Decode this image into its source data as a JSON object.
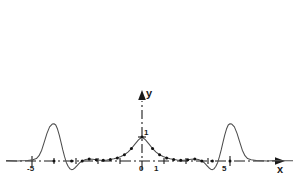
{
  "figure": {
    "background_color": "#ffffff",
    "curve_color": "#4d4d4d",
    "axis_color": "#1a1a1a",
    "marker_color": "#111111"
  },
  "axes": {
    "x_axis_label": "x",
    "y_axis_label": "y",
    "x_axis_style": "dash-dot with arrowhead at right",
    "y_axis_style": "dash-dot with arrowhead at top",
    "x_tick_labels": [
      "-5",
      "0",
      "1",
      "5"
    ],
    "y_tick_labels": [
      "1"
    ]
  },
  "chart_data": {
    "type": "line",
    "title": "",
    "subtitle": "",
    "xlabel": "x",
    "ylabel": "y",
    "xlim": [
      -7.7,
      9.6
    ],
    "ylim": [
      -0.45,
      1.75
    ],
    "grid": false,
    "legend": null,
    "x_ticks": [
      -5,
      0,
      1,
      5
    ],
    "x_tick_labels": [
      "-5",
      "0",
      "1",
      "5"
    ],
    "y_ticks": [
      1
    ],
    "y_tick_labels": [
      "1"
    ],
    "minor_x_ticks": [
      -4,
      -3,
      -2,
      -1,
      2,
      3,
      4
    ],
    "annotations": [
      {
        "text": "y",
        "x": 0.0,
        "y": 1.7,
        "role": "y-axis-label"
      },
      {
        "text": "x",
        "x": 9.4,
        "y": -0.22,
        "role": "x-axis-label"
      }
    ],
    "series": [
      {
        "name": "curve",
        "kind": "line",
        "x": [
          -7.7,
          -7.4,
          -7.1,
          -6.8,
          -6.5,
          -6.2,
          -6.0,
          -5.85,
          -5.7,
          -5.55,
          -5.4,
          -5.25,
          -5.1,
          -5.0,
          -4.9,
          -4.8,
          -4.7,
          -4.6,
          -4.5,
          -4.4,
          -4.3,
          -4.2,
          -4.1,
          -4.0,
          -3.9,
          -3.8,
          -3.7,
          -3.6,
          -3.5,
          -3.4,
          -3.2,
          -3.0,
          -2.8,
          -2.6,
          -2.4,
          -2.2,
          -2.0,
          -1.8,
          -1.6,
          -1.4,
          -1.2,
          -1.0,
          -0.8,
          -0.6,
          -0.4,
          -0.2,
          0.0,
          0.2,
          0.4,
          0.6,
          0.8,
          1.0,
          1.2,
          1.4,
          1.6,
          1.8,
          2.0,
          2.2,
          2.4,
          2.6,
          2.8,
          3.0,
          3.2,
          3.4,
          3.5,
          3.6,
          3.7,
          3.8,
          3.9,
          4.0,
          4.1,
          4.2,
          4.3,
          4.4,
          4.5,
          4.6,
          4.7,
          4.8,
          4.9,
          5.0,
          5.1,
          5.25,
          5.4,
          5.55,
          5.7,
          5.85,
          6.0,
          6.2,
          6.5,
          6.8,
          7.1,
          7.4,
          7.7,
          8.0,
          8.6,
          9.2
        ],
        "y": [
          0.02,
          0.01,
          0.0,
          0.01,
          0.02,
          0.05,
          0.1,
          0.22,
          0.45,
          0.8,
          1.15,
          1.42,
          1.54,
          1.55,
          1.5,
          1.33,
          1.08,
          0.78,
          0.46,
          0.18,
          -0.06,
          -0.22,
          -0.32,
          -0.36,
          -0.34,
          -0.28,
          -0.2,
          -0.12,
          -0.05,
          0.0,
          0.06,
          0.08,
          0.07,
          0.05,
          0.03,
          0.03,
          0.04,
          0.06,
          0.09,
          0.13,
          0.19,
          0.26,
          0.37,
          0.52,
          0.7,
          0.88,
          1.0,
          0.88,
          0.7,
          0.52,
          0.37,
          0.26,
          0.19,
          0.13,
          0.09,
          0.06,
          0.04,
          0.03,
          0.03,
          0.05,
          0.07,
          0.08,
          0.06,
          0.0,
          -0.05,
          -0.12,
          -0.2,
          -0.28,
          -0.34,
          -0.36,
          -0.32,
          -0.22,
          -0.06,
          0.18,
          0.46,
          0.78,
          1.08,
          1.33,
          1.5,
          1.55,
          1.54,
          1.42,
          1.15,
          0.8,
          0.45,
          0.22,
          0.1,
          0.05,
          0.02,
          0.01,
          0.0,
          0.01,
          0.02,
          0.01,
          0.01,
          0.0
        ]
      },
      {
        "name": "sample-markers",
        "kind": "scatter",
        "x": [
          -5.0,
          -4.0,
          -3.4,
          -3.0,
          -2.6,
          -2.2,
          -1.8,
          -1.4,
          -1.0,
          -0.6,
          0.0,
          0.6,
          1.0,
          1.4,
          1.8,
          2.2,
          2.6,
          3.0,
          3.4,
          4.0,
          5.0
        ],
        "y": [
          0.0,
          0.0,
          0.0,
          0.08,
          0.05,
          0.03,
          0.06,
          0.13,
          0.26,
          0.52,
          1.0,
          0.52,
          0.26,
          0.13,
          0.06,
          0.03,
          0.05,
          0.08,
          0.0,
          0.0,
          0.0
        ]
      }
    ]
  }
}
